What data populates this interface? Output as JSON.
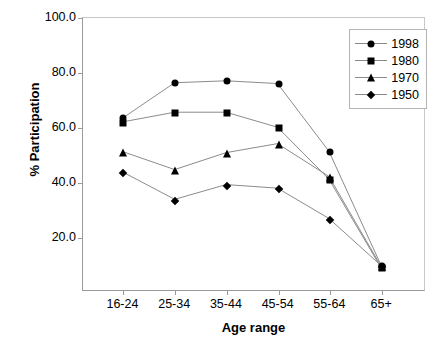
{
  "chart_data": {
    "type": "line",
    "title": "",
    "xlabel": "Age range",
    "ylabel": "% Participation",
    "categories": [
      "16-24",
      "25-34",
      "35-44",
      "45-54",
      "55-64",
      "65+"
    ],
    "ytick_labels": [
      "100.0",
      "80.0",
      "60.0",
      "40.0",
      "20.0"
    ],
    "ytick_values": [
      100.0,
      80.0,
      60.0,
      40.0,
      20.0
    ],
    "ylim": [
      0.4,
      100.0
    ],
    "grid": false,
    "legend_position": "top-right",
    "series": [
      {
        "name": "1998",
        "marker": "circle",
        "values": [
          63.5,
          76.3,
          77.0,
          76.0,
          51.2,
          10.0
        ]
      },
      {
        "name": "1980",
        "marker": "square",
        "values": [
          62.0,
          65.5,
          65.5,
          60.0,
          41.0,
          9.0
        ]
      },
      {
        "name": "1970",
        "marker": "triangle",
        "values": [
          51.0,
          44.5,
          50.7,
          54.0,
          42.0,
          9.5
        ]
      },
      {
        "name": "1950",
        "marker": "diamond",
        "values": [
          43.5,
          33.6,
          39.0,
          37.7,
          26.6,
          9.6
        ]
      }
    ],
    "colors": {
      "line": "#8a8a8a",
      "marker": "#000000",
      "axis": "#9a9a9a",
      "text": "#000000",
      "background": "#ffffff"
    }
  }
}
